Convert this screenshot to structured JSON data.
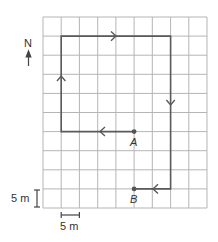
{
  "diagram": {
    "type": "grid-path",
    "grid": {
      "columns": 9,
      "rows": 10,
      "cell_size_m": 5
    },
    "compass": {
      "label": "N",
      "direction": "north"
    },
    "scale": {
      "vertical_label": "5 m",
      "horizontal_label": "5 m"
    },
    "points": [
      {
        "label": "A"
      },
      {
        "label": "B"
      }
    ],
    "path_description": "From A: west 4 squares, north 5 squares, east 6 squares, south 3+ squares down to row of B, then west 2 squares to B",
    "colors": {
      "grid": "#b0b0b0",
      "path": "#5a5a5a",
      "point": "#555555"
    }
  }
}
